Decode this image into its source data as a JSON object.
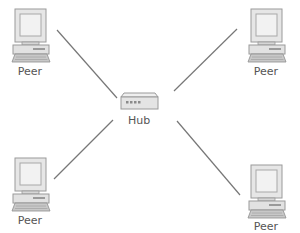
{
  "diagram": {
    "type": "star-topology",
    "center": {
      "id": "hub",
      "label": "Hub",
      "x": 138,
      "y": 100
    },
    "nodes": [
      {
        "id": "peer-top-left",
        "label": "Peer",
        "x": 30,
        "y": 35,
        "label_y": 66
      },
      {
        "id": "peer-top-right",
        "label": "Peer",
        "x": 266,
        "y": 35,
        "label_y": 66
      },
      {
        "id": "peer-bottom-left",
        "label": "Peer",
        "x": 30,
        "y": 184,
        "label_y": 215
      },
      {
        "id": "peer-bottom-right",
        "label": "Peer",
        "x": 266,
        "y": 191,
        "label_y": 221
      }
    ],
    "edges": [
      {
        "from": "peer-top-left",
        "to": "hub"
      },
      {
        "from": "peer-top-right",
        "to": "hub"
      },
      {
        "from": "peer-bottom-left",
        "to": "hub"
      },
      {
        "from": "peer-bottom-right",
        "to": "hub"
      }
    ],
    "colors": {
      "line": "#777777",
      "device_fill": "#e4e4e4",
      "device_stroke": "#9a9a9a",
      "label": "#555555"
    }
  }
}
